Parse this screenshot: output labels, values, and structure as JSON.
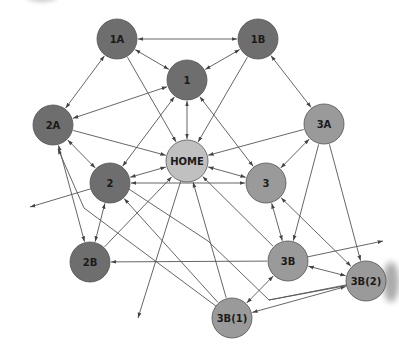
{
  "diagram": {
    "type": "site-navigation-graph",
    "colors": {
      "dark": "#6e6e6e",
      "medium": "#9a9a9a",
      "light": "#c0c0c0",
      "stroke": "#555555",
      "edge": "#555555",
      "text": "#1a1a1a"
    },
    "nodes": [
      {
        "id": "1A",
        "label": "1A",
        "x": 117,
        "y": 39,
        "r": 20,
        "shade": "dark"
      },
      {
        "id": "1B",
        "label": "1B",
        "x": 258,
        "y": 39,
        "r": 20,
        "shade": "dark"
      },
      {
        "id": "1",
        "label": "1",
        "x": 187,
        "y": 80,
        "r": 20,
        "shade": "dark"
      },
      {
        "id": "2A",
        "label": "2A",
        "x": 53,
        "y": 125,
        "r": 20,
        "shade": "dark"
      },
      {
        "id": "3A",
        "label": "3A",
        "x": 324,
        "y": 124,
        "r": 20,
        "shade": "medium"
      },
      {
        "id": "HOME",
        "label": "HOME",
        "x": 187,
        "y": 161,
        "r": 21,
        "shade": "light"
      },
      {
        "id": "2",
        "label": "2",
        "x": 110,
        "y": 183,
        "r": 20,
        "shade": "dark"
      },
      {
        "id": "3",
        "label": "3",
        "x": 266,
        "y": 183,
        "r": 20,
        "shade": "medium"
      },
      {
        "id": "2B",
        "label": "2B",
        "x": 90,
        "y": 262,
        "r": 20,
        "shade": "dark"
      },
      {
        "id": "3B",
        "label": "3B",
        "x": 288,
        "y": 261,
        "r": 20,
        "shade": "medium"
      },
      {
        "id": "3B(2)",
        "label": "3B(2)",
        "x": 366,
        "y": 281,
        "r": 20,
        "shade": "medium"
      },
      {
        "id": "3B(1)",
        "label": "3B(1)",
        "x": 232,
        "y": 318,
        "r": 20,
        "shade": "medium"
      }
    ],
    "edges": [
      {
        "from": "1B",
        "to": "1A",
        "dir": "both"
      },
      {
        "from": "1A",
        "to": "1",
        "dir": "both"
      },
      {
        "from": "1B",
        "to": "1",
        "dir": "both"
      },
      {
        "from": "1A",
        "to": "2A",
        "dir": "both"
      },
      {
        "from": "1",
        "to": "2A",
        "dir": "both"
      },
      {
        "from": "1A",
        "to": "HOME",
        "dir": "to"
      },
      {
        "from": "1",
        "to": "HOME",
        "dir": "both"
      },
      {
        "from": "1B",
        "to": "HOME",
        "dir": "to"
      },
      {
        "from": "1B",
        "to": "3A",
        "dir": "both"
      },
      {
        "from": "1",
        "to": "3",
        "dir": "both"
      },
      {
        "from": "1",
        "to": "2",
        "dir": "both"
      },
      {
        "from": "2A",
        "to": "HOME",
        "dir": "to"
      },
      {
        "from": "3A",
        "to": "HOME",
        "dir": "to"
      },
      {
        "from": "2A",
        "to": "2",
        "dir": "both"
      },
      {
        "from": "3A",
        "to": "3",
        "dir": "both"
      },
      {
        "from": "HOME",
        "to": "2",
        "dir": "both"
      },
      {
        "from": "HOME",
        "to": "3",
        "dir": "both"
      },
      {
        "from": "3",
        "to": "2",
        "dir": "both"
      },
      {
        "from": "2",
        "to": "2B",
        "dir": "both"
      },
      {
        "from": "2A",
        "to": "2B",
        "dir": "both"
      },
      {
        "from": "3",
        "to": "3B",
        "dir": "both"
      },
      {
        "from": "3A",
        "to": "3B",
        "dir": "to"
      },
      {
        "from": "3A",
        "to": "3B(2)",
        "dir": "to"
      },
      {
        "from": "3",
        "to": "3B(2)",
        "dir": "both"
      },
      {
        "from": "3B",
        "to": "3B(2)",
        "dir": "both"
      },
      {
        "from": "3B",
        "to": "3B(1)",
        "dir": "both"
      },
      {
        "from": "3B(2)",
        "to": "3B(1)",
        "dir": "both"
      },
      {
        "from": "3B",
        "to": "2B",
        "dir": "to"
      },
      {
        "from": "2B",
        "to": "HOME",
        "dir": "to"
      },
      {
        "from": "3B",
        "to": "HOME",
        "dir": "to"
      },
      {
        "from": "3B(1)",
        "to": "HOME",
        "dir": "to"
      },
      {
        "from": "3B(1)",
        "to": "2",
        "dir": "to"
      }
    ],
    "polylines": [
      {
        "points": [
          [
            110,
            183
          ],
          [
            30,
            207
          ]
        ],
        "arrow_end": true,
        "name": "edge-2-offpage-left"
      },
      {
        "points": [
          [
            187,
            161
          ],
          [
            138,
            318
          ]
        ],
        "arrow_end": true,
        "name": "edge-home-offpage-bottom"
      },
      {
        "points": [
          [
            288,
            261
          ],
          [
            383,
            241
          ]
        ],
        "arrow_end": true,
        "name": "edge-3b-offpage-right"
      },
      {
        "points": [
          [
            366,
            281
          ],
          [
            269,
            300
          ],
          [
            208,
            241
          ],
          [
            112,
            178
          ]
        ],
        "arrow_end": false,
        "name": "edge-3b2-bend"
      },
      {
        "points": [
          [
            232,
            318
          ],
          [
            84,
            208
          ],
          [
            58,
            149
          ]
        ],
        "arrow_end": true,
        "arrow_start": false,
        "name": "edge-3b1-to-2a"
      },
      {
        "points": [
          [
            350,
            285
          ],
          [
            269,
            300
          ]
        ],
        "arrow_end": false,
        "name": "edge-3b2-seg"
      }
    ]
  }
}
